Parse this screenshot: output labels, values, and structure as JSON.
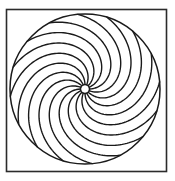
{
  "artwork": {
    "title": "Spiral Rosette",
    "description": "Black and white line drawing of a pinwheel rosette inside a square frame",
    "style": "line-art",
    "background_color": "#ffffff",
    "stroke_color": "#1a1a1a",
    "canvas": {
      "width": 175,
      "height": 181
    }
  },
  "frame": {
    "name": "square-border",
    "x": 6.5,
    "y": 9.5,
    "width": 160,
    "height": 162,
    "stroke_width": 1.6,
    "stroke_color": "#2b2b2b"
  },
  "rosette": {
    "center_x": 85,
    "center_y": 89,
    "outer_radius": 75,
    "outer_stroke_width": 1.5,
    "hub_radius": 4.5,
    "hub_stroke_width": 1.4,
    "arm_count": 16,
    "arm_stroke_width": 1.4,
    "arm_sweep_degrees": 118,
    "arm_direction": "counterclockwise",
    "arm_inner_radius": 4.5,
    "arm_outer_radius": 75
  },
  "chart_data": {
    "type": "scatter",
    "xlabel": "",
    "ylabel": "",
    "series": [
      {
        "name": "spiral-arms",
        "values": [
          0,
          22.5,
          45,
          67.5,
          90,
          112.5,
          135,
          157.5,
          180,
          202.5,
          225,
          247.5,
          270,
          292.5,
          315,
          337.5
        ]
      }
    ]
  }
}
